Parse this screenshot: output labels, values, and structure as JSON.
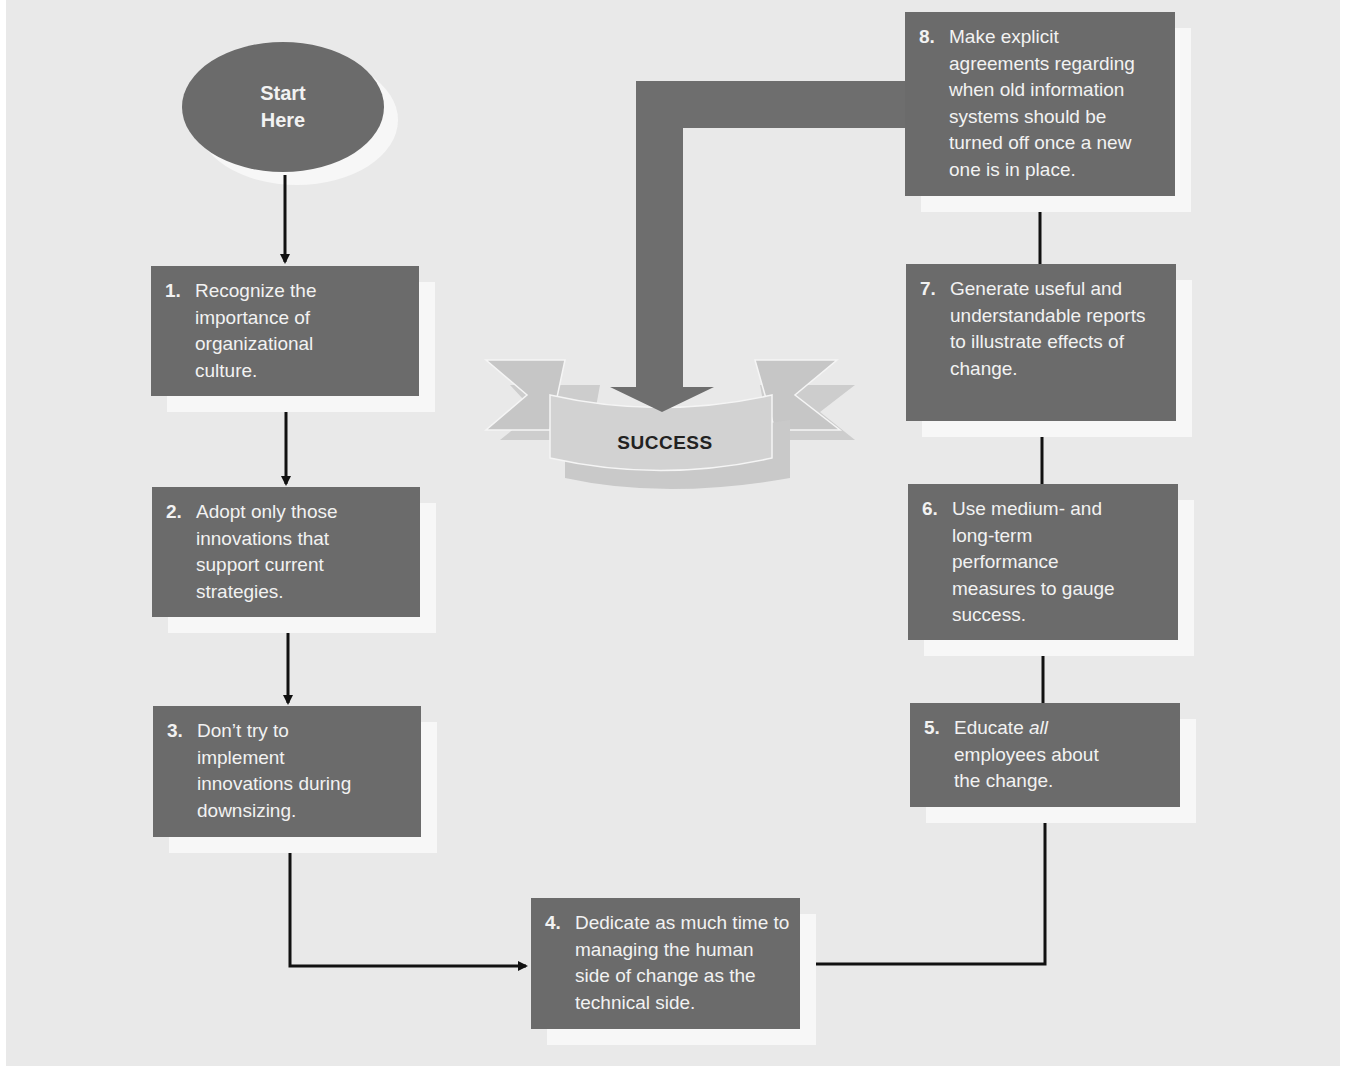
{
  "diagram": {
    "type": "flowchart",
    "start": {
      "line1": "Start",
      "line2": "Here"
    },
    "goal": {
      "label": "SUCCESS"
    },
    "steps": [
      {
        "num": "1.",
        "text": "Recognize the importance of organizational culture."
      },
      {
        "num": "2.",
        "text": "Adopt only those innovations that support current strategies."
      },
      {
        "num": "3.",
        "text": "Don’t try to implement innovations during downsizing."
      },
      {
        "num": "4.",
        "text": "Dedicate as much time to managing the human side of change as the technical side."
      },
      {
        "num": "5.",
        "text_before": "Educate ",
        "text_emphasis": "all",
        "text_after": " employees about the change."
      },
      {
        "num": "6.",
        "text": "Use medium- and long-term performance measures to gauge success."
      },
      {
        "num": "7.",
        "text": "Generate useful and understandable reports to illustrate effects of change."
      },
      {
        "num": "8.",
        "text": "Make explicit agreements regarding when old information systems should be turned off once a new one is in place."
      }
    ],
    "flow": [
      "start",
      "1",
      "2",
      "3",
      "4",
      "5",
      "6",
      "7",
      "8",
      "SUCCESS"
    ],
    "colors": {
      "background": "#e9e9e9",
      "box_fill": "#6b6b6b",
      "box_text": "#f2f2f2",
      "box_shadow": "#f7f7f7",
      "connector": "#111111",
      "big_arrow": "#6e6e6e",
      "ribbon": "#cfcfcf",
      "ribbon_tail": "#c4c4c4"
    }
  }
}
